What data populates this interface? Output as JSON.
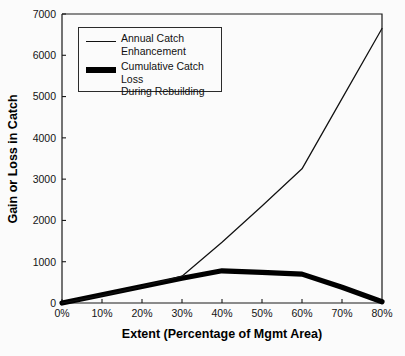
{
  "chart_data": {
    "type": "line",
    "title": "",
    "xlabel": "Extent (Percentage of Mgmt Area)",
    "ylabel": "Gain or Loss in Catch",
    "x": [
      0,
      10,
      20,
      30,
      40,
      50,
      60,
      70,
      80
    ],
    "categories": [
      "0%",
      "10%",
      "20%",
      "30%",
      "40%",
      "50%",
      "60%",
      "70%",
      "80%"
    ],
    "xtick_labels": [
      "0%",
      "10%",
      "20%",
      "30%",
      "40%",
      "50%",
      "60%",
      "70%",
      "80%"
    ],
    "ytick_labels": [
      "0",
      "1000",
      "2000",
      "3000",
      "4000",
      "5000",
      "6000",
      "7000"
    ],
    "ytick_values": [
      0,
      1000,
      2000,
      3000,
      4000,
      5000,
      6000,
      7000
    ],
    "xlim": [
      0,
      80
    ],
    "ylim": [
      0,
      7000
    ],
    "grid": false,
    "legend_position": "upper-left",
    "series": [
      {
        "name": "Annual Catch Enhancement",
        "legend_label": "Annual Catch\nEnhancement",
        "style": "thin-line",
        "color": "#111111",
        "values": [
          0,
          180,
          400,
          650,
          1470,
          2350,
          3250,
          4950,
          6650
        ]
      },
      {
        "name": "Cumulative Catch Loss During Rebuilding",
        "legend_label": "Cumulative Catch Loss\nDuring Rebuilding",
        "style": "thick-line",
        "color": "#000000",
        "values": [
          0,
          200,
          400,
          600,
          780,
          740,
          700,
          380,
          30
        ]
      }
    ]
  },
  "axes": {
    "y_title": "Gain or Loss in Catch",
    "x_title": "Extent (Percentage of Mgmt Area)"
  },
  "legend": {
    "entries": [
      {
        "label": "Annual Catch\nEnhancement",
        "swatch": "thin-line-swatch"
      },
      {
        "label": "Cumulative Catch Loss\nDuring Rebuilding",
        "swatch": "thick-line-swatch"
      }
    ]
  }
}
